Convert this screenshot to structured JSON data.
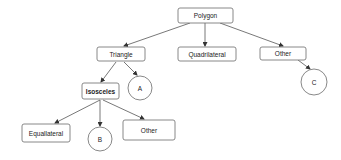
{
  "diagram": {
    "type": "tree",
    "colors": {
      "node_stroke": "#7a7a7a",
      "edge": "#555555",
      "text": "#222222",
      "background": "#ffffff"
    },
    "nodes": {
      "polygon": {
        "label": "Polygon",
        "shape": "rect"
      },
      "triangle": {
        "label": "Triangle",
        "shape": "rect"
      },
      "quadrilateral": {
        "label": "Quadrilateral",
        "shape": "rect"
      },
      "other_top": {
        "label": "Other",
        "shape": "rect"
      },
      "c": {
        "label": "C",
        "shape": "circle"
      },
      "isosceles": {
        "label": "Isosceles",
        "shape": "rect"
      },
      "a": {
        "label": "A",
        "shape": "circle"
      },
      "equallateral": {
        "label": "Equallateral",
        "shape": "rect"
      },
      "b": {
        "label": "B",
        "shape": "circle"
      },
      "other_bottom": {
        "label": "Other",
        "shape": "rect"
      }
    },
    "edges": [
      {
        "from": "Polygon",
        "to": "Triangle"
      },
      {
        "from": "Polygon",
        "to": "Quadrilateral"
      },
      {
        "from": "Polygon",
        "to": "Other"
      },
      {
        "from": "Other",
        "to": "C"
      },
      {
        "from": "Triangle",
        "to": "Isosceles"
      },
      {
        "from": "Triangle",
        "to": "A"
      },
      {
        "from": "Isosceles",
        "to": "Equallateral"
      },
      {
        "from": "Isosceles",
        "to": "B"
      },
      {
        "from": "Isosceles",
        "to": "Other"
      }
    ]
  }
}
